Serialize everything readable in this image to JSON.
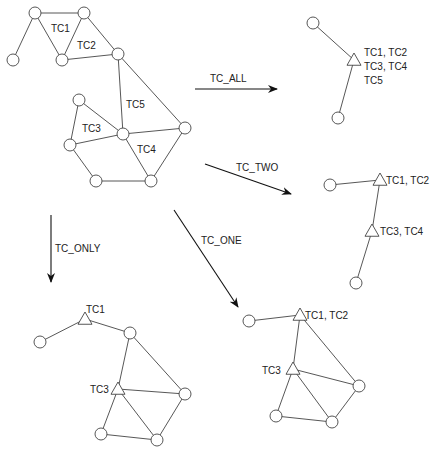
{
  "diagram": {
    "colors": {
      "line": "#444444",
      "arrow": "#111111",
      "text": "#222222",
      "background": "#ffffff"
    },
    "source_graph": {
      "nodes": [
        {
          "id": "A",
          "x": 35,
          "y": 13
        },
        {
          "id": "B",
          "x": 84,
          "y": 13
        },
        {
          "id": "C",
          "x": 13,
          "y": 60
        },
        {
          "id": "D",
          "x": 62,
          "y": 60
        },
        {
          "id": "E",
          "x": 118,
          "y": 54
        },
        {
          "id": "F",
          "x": 79,
          "y": 100
        },
        {
          "id": "G",
          "x": 123,
          "y": 134
        },
        {
          "id": "H",
          "x": 70,
          "y": 145
        },
        {
          "id": "I",
          "x": 185,
          "y": 128
        },
        {
          "id": "J",
          "x": 96,
          "y": 181
        },
        {
          "id": "K",
          "x": 151,
          "y": 181
        }
      ],
      "edges": [
        [
          "A",
          "B"
        ],
        [
          "A",
          "C"
        ],
        [
          "A",
          "D"
        ],
        [
          "B",
          "D"
        ],
        [
          "B",
          "E"
        ],
        [
          "D",
          "E"
        ],
        [
          "E",
          "G"
        ],
        [
          "E",
          "I"
        ],
        [
          "F",
          "G"
        ],
        [
          "F",
          "H"
        ],
        [
          "H",
          "G"
        ],
        [
          "G",
          "I"
        ],
        [
          "H",
          "J"
        ],
        [
          "J",
          "K"
        ],
        [
          "G",
          "K"
        ],
        [
          "K",
          "I"
        ]
      ],
      "labels": [
        {
          "text": "TC1",
          "x": 51,
          "y": 32
        },
        {
          "text": "TC2",
          "x": 77,
          "y": 49
        },
        {
          "text": "TC5",
          "x": 126,
          "y": 108
        },
        {
          "text": "TC3",
          "x": 82,
          "y": 132
        },
        {
          "text": "TC4",
          "x": 137,
          "y": 153
        }
      ]
    },
    "transforms": [
      {
        "name": "TC_ALL",
        "label": "TC_ALL",
        "from": [
          195,
          89
        ],
        "to": [
          277,
          89
        ],
        "label_x": 210,
        "label_y": 82
      },
      {
        "name": "TC_TWO",
        "label": "TC_TWO",
        "from": [
          205,
          164
        ],
        "to": [
          291,
          194
        ],
        "label_x": 236,
        "label_y": 171
      },
      {
        "name": "TC_ONE",
        "label": "TC_ONE",
        "from": [
          174,
          210
        ],
        "to": [
          238,
          307
        ],
        "label_x": 201,
        "label_y": 244
      },
      {
        "name": "TC_ONLY",
        "label": "TC_ONLY",
        "from": [
          51,
          215
        ],
        "to": [
          51,
          282
        ],
        "label_x": 55,
        "label_y": 252
      }
    ],
    "result_tc_all": {
      "circles": [
        {
          "x": 313,
          "y": 23
        },
        {
          "x": 338,
          "y": 118
        }
      ],
      "triangles": [
        {
          "x": 354,
          "y": 60
        }
      ],
      "edges": [
        [
          313,
          23,
          354,
          60
        ],
        [
          338,
          118,
          354,
          60
        ]
      ],
      "labels": [
        {
          "text": "TC1, TC2",
          "x": 364,
          "y": 56
        },
        {
          "text": "TC3, TC4",
          "x": 364,
          "y": 70
        },
        {
          "text": "TC5",
          "x": 364,
          "y": 84
        }
      ]
    },
    "result_tc_two": {
      "circles": [
        {
          "x": 330,
          "y": 185
        },
        {
          "x": 356,
          "y": 283
        }
      ],
      "triangles": [
        {
          "x": 380,
          "y": 180
        },
        {
          "x": 372,
          "y": 231
        }
      ],
      "edges": [
        [
          330,
          185,
          380,
          180
        ],
        [
          380,
          180,
          372,
          231
        ],
        [
          372,
          231,
          356,
          283
        ]
      ],
      "labels": [
        {
          "text": "TC1, TC2",
          "x": 386,
          "y": 184
        },
        {
          "text": "TC3, TC4",
          "x": 380,
          "y": 235
        }
      ]
    },
    "result_tc_only": {
      "circles": [
        {
          "x": 40,
          "y": 342
        },
        {
          "x": 130,
          "y": 333
        },
        {
          "x": 185,
          "y": 394
        },
        {
          "x": 101,
          "y": 434
        },
        {
          "x": 157,
          "y": 440
        }
      ],
      "triangles": [
        {
          "x": 85,
          "y": 319
        },
        {
          "x": 118,
          "y": 389
        }
      ],
      "edges": [
        [
          40,
          342,
          85,
          319
        ],
        [
          85,
          319,
          130,
          333
        ],
        [
          130,
          333,
          118,
          389
        ],
        [
          130,
          333,
          185,
          394
        ],
        [
          118,
          389,
          185,
          394
        ],
        [
          118,
          389,
          101,
          434
        ],
        [
          118,
          389,
          157,
          440
        ],
        [
          101,
          434,
          157,
          440
        ],
        [
          157,
          440,
          185,
          394
        ]
      ],
      "labels": [
        {
          "text": "TC1",
          "x": 86,
          "y": 313
        },
        {
          "text": "TC3",
          "x": 90,
          "y": 393
        }
      ]
    },
    "result_tc_one": {
      "circles": [
        {
          "x": 249,
          "y": 321
        },
        {
          "x": 359,
          "y": 386
        },
        {
          "x": 276,
          "y": 416
        },
        {
          "x": 332,
          "y": 422
        }
      ],
      "triangles": [
        {
          "x": 300,
          "y": 315
        },
        {
          "x": 293,
          "y": 369
        }
      ],
      "edges": [
        [
          249,
          321,
          300,
          315
        ],
        [
          300,
          315,
          293,
          369
        ],
        [
          300,
          315,
          359,
          386
        ],
        [
          293,
          369,
          359,
          386
        ],
        [
          293,
          369,
          276,
          416
        ],
        [
          293,
          369,
          332,
          422
        ],
        [
          276,
          416,
          332,
          422
        ],
        [
          332,
          422,
          359,
          386
        ]
      ],
      "labels": [
        {
          "text": "TC1, TC2",
          "x": 305,
          "y": 319
        },
        {
          "text": "TC3",
          "x": 262,
          "y": 374
        }
      ]
    }
  }
}
